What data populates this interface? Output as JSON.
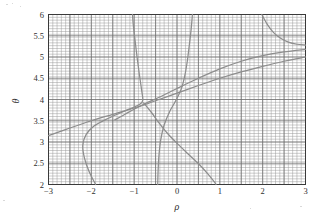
{
  "figure": {
    "background_color": "#ffffff",
    "frame_color": "#3a3a3a",
    "curve_color": "#8d8d8d",
    "grid_minor_color": "#9a9a9a",
    "grid_major_color": "#6d6d6d"
  },
  "chart_data": {
    "type": "line",
    "title": "",
    "xlabel": "ρ",
    "ylabel": "θ",
    "xlim": [
      -3,
      3
    ],
    "ylim": [
      2,
      6
    ],
    "grid": true,
    "grid_minor": true,
    "legend": "none",
    "xticks": [
      -3,
      -2,
      -1,
      0,
      1,
      2,
      3
    ],
    "xticklabels": [
      "−3",
      "−2",
      "−1",
      "0",
      "1",
      "2",
      "3"
    ],
    "yticks": [
      2,
      2.5,
      3,
      3.5,
      4,
      4.5,
      5,
      5.5,
      6
    ],
    "yticklabels": [
      "2",
      "2.5",
      "3",
      "3.5",
      "4",
      "4.5",
      "5",
      "5.5",
      "6"
    ],
    "x_major_step": 1,
    "y_major_step": 0.5,
    "x_minor_step": 0.1,
    "y_minor_step": 0.0667,
    "convergence_point": [
      -0.75,
      3.9
    ],
    "series": [
      {
        "name": "branch-lower-rising",
        "points": [
          [
            -3.0,
            3.15
          ],
          [
            -2.5,
            3.33
          ],
          [
            -2.0,
            3.5
          ],
          [
            -1.5,
            3.65
          ],
          [
            -1.0,
            3.8
          ],
          [
            -0.75,
            3.88
          ],
          [
            -0.5,
            3.97
          ],
          [
            0.0,
            4.15
          ],
          [
            0.5,
            4.33
          ],
          [
            1.0,
            4.5
          ],
          [
            1.5,
            4.65
          ],
          [
            2.0,
            4.78
          ],
          [
            2.5,
            4.9
          ],
          [
            3.0,
            5.0
          ]
        ]
      },
      {
        "name": "branch-upper-rising",
        "points": [
          [
            -1.45,
            3.52
          ],
          [
            -1.2,
            3.66
          ],
          [
            -1.0,
            3.77
          ],
          [
            -0.75,
            3.9
          ],
          [
            -0.4,
            4.06
          ],
          [
            0.0,
            4.26
          ],
          [
            0.5,
            4.5
          ],
          [
            1.0,
            4.72
          ],
          [
            1.5,
            4.9
          ],
          [
            2.0,
            5.03
          ],
          [
            2.5,
            5.12
          ],
          [
            3.0,
            5.18
          ]
        ]
      },
      {
        "name": "branch-steep-rising",
        "points": [
          [
            -0.45,
            2.0
          ],
          [
            -0.44,
            2.35
          ],
          [
            -0.42,
            2.7
          ],
          [
            -0.38,
            3.05
          ],
          [
            -0.3,
            3.4
          ],
          [
            -0.17,
            3.72
          ],
          [
            -0.03,
            3.97
          ],
          [
            0.1,
            4.25
          ],
          [
            0.18,
            4.55
          ],
          [
            0.24,
            4.9
          ],
          [
            0.29,
            5.3
          ],
          [
            0.33,
            5.65
          ],
          [
            0.36,
            6.0
          ]
        ]
      },
      {
        "name": "branch-left-hook",
        "points": [
          [
            -1.9,
            2.0
          ],
          [
            -2.05,
            2.3
          ],
          [
            -2.16,
            2.62
          ],
          [
            -2.2,
            2.92
          ],
          [
            -2.12,
            3.18
          ],
          [
            -1.93,
            3.38
          ],
          [
            -1.68,
            3.52
          ],
          [
            -1.38,
            3.66
          ],
          [
            -1.1,
            3.78
          ],
          [
            -0.88,
            3.88
          ],
          [
            -0.8,
            3.98
          ],
          [
            -0.83,
            4.25
          ],
          [
            -0.88,
            4.6
          ],
          [
            -0.93,
            4.98
          ],
          [
            -0.98,
            5.4
          ],
          [
            -1.02,
            5.75
          ],
          [
            -1.04,
            6.0
          ]
        ]
      },
      {
        "name": "branch-descending-right",
        "points": [
          [
            -0.78,
            3.92
          ],
          [
            -0.6,
            3.7
          ],
          [
            -0.42,
            3.45
          ],
          [
            -0.22,
            3.2
          ],
          [
            0.02,
            2.95
          ],
          [
            0.28,
            2.7
          ],
          [
            0.52,
            2.47
          ],
          [
            0.72,
            2.25
          ],
          [
            0.88,
            2.05
          ],
          [
            0.91,
            2.0
          ]
        ]
      },
      {
        "name": "branch-upper-right",
        "points": [
          [
            1.98,
            6.0
          ],
          [
            2.1,
            5.78
          ],
          [
            2.25,
            5.58
          ],
          [
            2.42,
            5.44
          ],
          [
            2.6,
            5.35
          ],
          [
            2.8,
            5.3
          ],
          [
            3.0,
            5.28
          ]
        ]
      }
    ]
  }
}
